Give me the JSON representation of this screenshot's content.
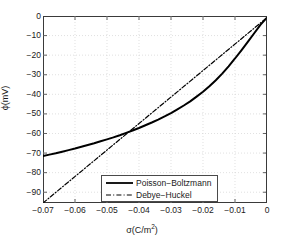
{
  "chart_data": {
    "type": "line",
    "title": "",
    "xlabel": "σ(C/m²)",
    "xlabel_base": "σ(C/m",
    "xlabel_sup": "2",
    "xlabel_close": ")",
    "ylabel": "ϕ(mV)",
    "xlim": [
      -0.07,
      0
    ],
    "ylim": [
      -95.5,
      0
    ],
    "grid": true,
    "legend_position": "bottom-center",
    "xticks": [
      -0.07,
      -0.06,
      -0.05,
      -0.04,
      -0.03,
      -0.02,
      -0.01,
      0
    ],
    "xtick_labels": [
      "-0.07",
      "-0.06",
      "-0.05",
      "-0.04",
      "-0.03",
      "-0.02",
      "-0.01",
      "0"
    ],
    "yticks": [
      0,
      -10,
      -20,
      -30,
      -40,
      -50,
      -60,
      -70,
      -80,
      -90
    ],
    "ytick_labels": [
      "0",
      "-10",
      "-20",
      "-30",
      "-40",
      "-50",
      "-60",
      "-70",
      "-80",
      "-90"
    ],
    "series": [
      {
        "name": "Poisson−Boltzmann",
        "style": "solid",
        "color": "#000000",
        "x": [
          -0.07,
          -0.068,
          -0.066,
          -0.064,
          -0.062,
          -0.06,
          -0.058,
          -0.056,
          -0.054,
          -0.052,
          -0.05,
          -0.048,
          -0.046,
          -0.044,
          -0.042,
          -0.04,
          -0.038,
          -0.036,
          -0.034,
          -0.032,
          -0.03,
          -0.028,
          -0.026,
          -0.024,
          -0.022,
          -0.02,
          -0.018,
          -0.016,
          -0.014,
          -0.012,
          -0.01,
          -0.008,
          -0.006,
          -0.004,
          -0.002,
          0.0
        ],
        "y": [
          -71.5,
          -70.8,
          -70.1,
          -69.3,
          -68.5,
          -67.7,
          -66.8,
          -65.9,
          -65.0,
          -64.0,
          -63.0,
          -62.0,
          -60.9,
          -59.7,
          -58.5,
          -57.2,
          -55.8,
          -54.4,
          -52.9,
          -51.3,
          -49.6,
          -47.7,
          -45.7,
          -43.6,
          -41.2,
          -38.7,
          -35.9,
          -32.8,
          -29.4,
          -25.7,
          -21.7,
          -17.5,
          -13.2,
          -8.8,
          -4.4,
          -0.8
        ]
      },
      {
        "name": "Debye−Huckel",
        "style": "dashdot",
        "color": "#000000",
        "x": [
          -0.07,
          0.0
        ],
        "y": [
          -95.5,
          -0.8
        ]
      }
    ]
  },
  "legend": {
    "entries": [
      {
        "label": "Poisson−Boltzmann",
        "style": "solid"
      },
      {
        "label": "Debye−Huckel",
        "style": "dashdot"
      }
    ]
  }
}
